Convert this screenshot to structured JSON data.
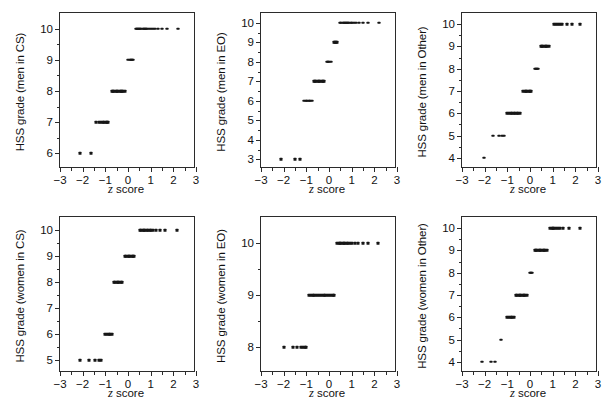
{
  "figure": {
    "axis_labels": {
      "x": "z score",
      "x_italic_part": "z",
      "x_rest": " score"
    },
    "x_range": [
      -3,
      3
    ],
    "x_ticks": [
      -3,
      -2,
      -1,
      0,
      1,
      2,
      3
    ],
    "x_tick_labels": [
      "−3",
      "−2",
      "−1",
      "0",
      "1",
      "2",
      "3"
    ]
  },
  "chart_data": [
    {
      "type": "scatter",
      "title": "",
      "xlabel": "z score",
      "ylabel": "HSS grade (men in CS)",
      "xlim": [
        -3,
        3
      ],
      "ylim": [
        5.5,
        10.5
      ],
      "yticks": [
        6,
        7,
        8,
        9,
        10
      ],
      "ytick_labels": [
        "6",
        "7",
        "8",
        "9",
        "10"
      ],
      "grid": false,
      "legend": "none",
      "points": [
        {
          "x": -2.12,
          "y": 6
        },
        {
          "x": -1.65,
          "y": 6
        },
        {
          "x": -1.42,
          "y": 7
        },
        {
          "x": -1.3,
          "y": 7
        },
        {
          "x": -1.2,
          "y": 7
        },
        {
          "x": -1.12,
          "y": 7
        },
        {
          "x": -1.05,
          "y": 7
        },
        {
          "x": -0.99,
          "y": 7
        },
        {
          "x": -0.93,
          "y": 7
        },
        {
          "x": -0.88,
          "y": 7
        },
        {
          "x": -0.72,
          "y": 8
        },
        {
          "x": -0.66,
          "y": 8
        },
        {
          "x": -0.6,
          "y": 8
        },
        {
          "x": -0.54,
          "y": 8
        },
        {
          "x": -0.48,
          "y": 8
        },
        {
          "x": -0.42,
          "y": 8
        },
        {
          "x": -0.36,
          "y": 8
        },
        {
          "x": -0.3,
          "y": 8
        },
        {
          "x": -0.25,
          "y": 8
        },
        {
          "x": -0.2,
          "y": 8
        },
        {
          "x": -0.15,
          "y": 8
        },
        {
          "x": 0.02,
          "y": 9
        },
        {
          "x": 0.07,
          "y": 9
        },
        {
          "x": 0.12,
          "y": 9
        },
        {
          "x": 0.17,
          "y": 9
        },
        {
          "x": 0.22,
          "y": 9
        },
        {
          "x": 0.34,
          "y": 10
        },
        {
          "x": 0.39,
          "y": 10
        },
        {
          "x": 0.44,
          "y": 10
        },
        {
          "x": 0.49,
          "y": 10
        },
        {
          "x": 0.54,
          "y": 10
        },
        {
          "x": 0.59,
          "y": 10
        },
        {
          "x": 0.64,
          "y": 10
        },
        {
          "x": 0.69,
          "y": 10
        },
        {
          "x": 0.74,
          "y": 10
        },
        {
          "x": 0.79,
          "y": 10
        },
        {
          "x": 0.85,
          "y": 10
        },
        {
          "x": 0.92,
          "y": 10
        },
        {
          "x": 1.0,
          "y": 10
        },
        {
          "x": 1.09,
          "y": 10
        },
        {
          "x": 1.2,
          "y": 10
        },
        {
          "x": 1.33,
          "y": 10
        },
        {
          "x": 1.5,
          "y": 10
        },
        {
          "x": 1.72,
          "y": 10
        },
        {
          "x": 2.2,
          "y": 10
        }
      ]
    },
    {
      "type": "scatter",
      "title": "",
      "xlabel": "z score",
      "ylabel": "HSS grade (men in EO)",
      "xlim": [
        -3,
        3
      ],
      "ylim": [
        2.5,
        10.5
      ],
      "yticks": [
        3,
        4,
        5,
        6,
        7,
        8,
        9,
        10
      ],
      "ytick_labels": [
        "3",
        "4",
        "5",
        "6",
        "7",
        "8",
        "9",
        "10"
      ],
      "grid": false,
      "legend": "none",
      "points": [
        {
          "x": -2.12,
          "y": 3
        },
        {
          "x": -1.5,
          "y": 3
        },
        {
          "x": -1.3,
          "y": 3
        },
        {
          "x": -1.1,
          "y": 6
        },
        {
          "x": -1.03,
          "y": 6
        },
        {
          "x": -0.96,
          "y": 6
        },
        {
          "x": -0.89,
          "y": 6
        },
        {
          "x": -0.82,
          "y": 6
        },
        {
          "x": -0.76,
          "y": 6
        },
        {
          "x": -0.68,
          "y": 7
        },
        {
          "x": -0.62,
          "y": 7
        },
        {
          "x": -0.56,
          "y": 7
        },
        {
          "x": -0.5,
          "y": 7
        },
        {
          "x": -0.44,
          "y": 7
        },
        {
          "x": -0.38,
          "y": 7
        },
        {
          "x": -0.32,
          "y": 7
        },
        {
          "x": -0.26,
          "y": 7
        },
        {
          "x": -0.2,
          "y": 7
        },
        {
          "x": -0.08,
          "y": 8
        },
        {
          "x": -0.03,
          "y": 8
        },
        {
          "x": 0.02,
          "y": 8
        },
        {
          "x": 0.07,
          "y": 8
        },
        {
          "x": 0.2,
          "y": 9
        },
        {
          "x": 0.25,
          "y": 9
        },
        {
          "x": 0.3,
          "y": 9
        },
        {
          "x": 0.35,
          "y": 9
        },
        {
          "x": 0.5,
          "y": 10
        },
        {
          "x": 0.55,
          "y": 10
        },
        {
          "x": 0.6,
          "y": 10
        },
        {
          "x": 0.65,
          "y": 10
        },
        {
          "x": 0.7,
          "y": 10
        },
        {
          "x": 0.75,
          "y": 10
        },
        {
          "x": 0.8,
          "y": 10
        },
        {
          "x": 0.85,
          "y": 10
        },
        {
          "x": 0.9,
          "y": 10
        },
        {
          "x": 0.96,
          "y": 10
        },
        {
          "x": 1.03,
          "y": 10
        },
        {
          "x": 1.11,
          "y": 10
        },
        {
          "x": 1.2,
          "y": 10
        },
        {
          "x": 1.32,
          "y": 10
        },
        {
          "x": 1.48,
          "y": 10
        },
        {
          "x": 1.7,
          "y": 10
        },
        {
          "x": 2.2,
          "y": 10
        }
      ]
    },
    {
      "type": "scatter",
      "title": "",
      "xlabel": "z score",
      "ylabel": "HSS grade (men in Other)",
      "xlim": [
        -3,
        3
      ],
      "ylim": [
        3.5,
        10.5
      ],
      "yticks": [
        4,
        5,
        6,
        7,
        8,
        9,
        10
      ],
      "ytick_labels": [
        "4",
        "5",
        "6",
        "7",
        "8",
        "9",
        "10"
      ],
      "grid": false,
      "legend": "none",
      "points": [
        {
          "x": -2.05,
          "y": 4
        },
        {
          "x": -1.62,
          "y": 5
        },
        {
          "x": -1.38,
          "y": 5
        },
        {
          "x": -1.25,
          "y": 5
        },
        {
          "x": -1.13,
          "y": 5
        },
        {
          "x": -1.0,
          "y": 6
        },
        {
          "x": -0.93,
          "y": 6
        },
        {
          "x": -0.86,
          "y": 6
        },
        {
          "x": -0.79,
          "y": 6
        },
        {
          "x": -0.72,
          "y": 6
        },
        {
          "x": -0.65,
          "y": 6
        },
        {
          "x": -0.58,
          "y": 6
        },
        {
          "x": -0.51,
          "y": 6
        },
        {
          "x": -0.45,
          "y": 6
        },
        {
          "x": -0.3,
          "y": 7
        },
        {
          "x": -0.24,
          "y": 7
        },
        {
          "x": -0.18,
          "y": 7
        },
        {
          "x": -0.12,
          "y": 7
        },
        {
          "x": -0.06,
          "y": 7
        },
        {
          "x": 0.0,
          "y": 7
        },
        {
          "x": 0.06,
          "y": 7
        },
        {
          "x": 0.2,
          "y": 8
        },
        {
          "x": 0.25,
          "y": 8
        },
        {
          "x": 0.3,
          "y": 8
        },
        {
          "x": 0.35,
          "y": 8
        },
        {
          "x": 0.47,
          "y": 9
        },
        {
          "x": 0.53,
          "y": 9
        },
        {
          "x": 0.59,
          "y": 9
        },
        {
          "x": 0.65,
          "y": 9
        },
        {
          "x": 0.71,
          "y": 9
        },
        {
          "x": 0.77,
          "y": 9
        },
        {
          "x": 0.83,
          "y": 9
        },
        {
          "x": 1.08,
          "y": 10
        },
        {
          "x": 1.16,
          "y": 10
        },
        {
          "x": 1.24,
          "y": 10
        },
        {
          "x": 1.33,
          "y": 10
        },
        {
          "x": 1.43,
          "y": 10
        },
        {
          "x": 1.62,
          "y": 10
        },
        {
          "x": 1.85,
          "y": 10
        },
        {
          "x": 2.2,
          "y": 10
        }
      ]
    },
    {
      "type": "scatter",
      "title": "",
      "xlabel": "z score",
      "ylabel": "HSS grade (women in CS)",
      "xlim": [
        -3,
        3
      ],
      "ylim": [
        4.5,
        10.5
      ],
      "yticks": [
        5,
        6,
        7,
        8,
        9,
        10
      ],
      "ytick_labels": [
        "5",
        "6",
        "7",
        "8",
        "9",
        "10"
      ],
      "grid": false,
      "legend": "none",
      "points": [
        {
          "x": -2.1,
          "y": 5
        },
        {
          "x": -1.7,
          "y": 5
        },
        {
          "x": -1.45,
          "y": 5
        },
        {
          "x": -1.3,
          "y": 5
        },
        {
          "x": -1.2,
          "y": 5
        },
        {
          "x": -1.0,
          "y": 6
        },
        {
          "x": -0.93,
          "y": 6
        },
        {
          "x": -0.86,
          "y": 6
        },
        {
          "x": -0.79,
          "y": 6
        },
        {
          "x": -0.72,
          "y": 6
        },
        {
          "x": -0.62,
          "y": 8
        },
        {
          "x": -0.56,
          "y": 8
        },
        {
          "x": -0.5,
          "y": 8
        },
        {
          "x": -0.44,
          "y": 8
        },
        {
          "x": -0.38,
          "y": 8
        },
        {
          "x": -0.32,
          "y": 8
        },
        {
          "x": -0.26,
          "y": 8
        },
        {
          "x": -0.14,
          "y": 9
        },
        {
          "x": -0.08,
          "y": 9
        },
        {
          "x": -0.02,
          "y": 9
        },
        {
          "x": 0.04,
          "y": 9
        },
        {
          "x": 0.1,
          "y": 9
        },
        {
          "x": 0.16,
          "y": 9
        },
        {
          "x": 0.22,
          "y": 9
        },
        {
          "x": 0.28,
          "y": 9
        },
        {
          "x": 0.52,
          "y": 10
        },
        {
          "x": 0.58,
          "y": 10
        },
        {
          "x": 0.64,
          "y": 10
        },
        {
          "x": 0.7,
          "y": 10
        },
        {
          "x": 0.76,
          "y": 10
        },
        {
          "x": 0.82,
          "y": 10
        },
        {
          "x": 0.88,
          "y": 10
        },
        {
          "x": 0.95,
          "y": 10
        },
        {
          "x": 1.03,
          "y": 10
        },
        {
          "x": 1.12,
          "y": 10
        },
        {
          "x": 1.24,
          "y": 10
        },
        {
          "x": 1.42,
          "y": 10
        },
        {
          "x": 1.65,
          "y": 10
        },
        {
          "x": 2.15,
          "y": 10
        }
      ]
    },
    {
      "type": "scatter",
      "title": "",
      "xlabel": "z score",
      "ylabel": "HSS grade (women in EO)",
      "xlim": [
        -3,
        3
      ],
      "ylim": [
        7.5,
        10.5
      ],
      "yticks": [
        8,
        9,
        10
      ],
      "ytick_labels": [
        "8",
        "9",
        "10"
      ],
      "grid": false,
      "legend": "none",
      "points": [
        {
          "x": -2.0,
          "y": 8
        },
        {
          "x": -1.6,
          "y": 8
        },
        {
          "x": -1.4,
          "y": 8
        },
        {
          "x": -1.25,
          "y": 8
        },
        {
          "x": -1.15,
          "y": 8
        },
        {
          "x": -1.08,
          "y": 8
        },
        {
          "x": -1.02,
          "y": 8
        },
        {
          "x": -0.88,
          "y": 9
        },
        {
          "x": -0.8,
          "y": 9
        },
        {
          "x": -0.72,
          "y": 9
        },
        {
          "x": -0.64,
          "y": 9
        },
        {
          "x": -0.56,
          "y": 9
        },
        {
          "x": -0.48,
          "y": 9
        },
        {
          "x": -0.4,
          "y": 9
        },
        {
          "x": -0.32,
          "y": 9
        },
        {
          "x": -0.24,
          "y": 9
        },
        {
          "x": -0.16,
          "y": 9
        },
        {
          "x": -0.08,
          "y": 9
        },
        {
          "x": 0.0,
          "y": 9
        },
        {
          "x": 0.08,
          "y": 9
        },
        {
          "x": 0.16,
          "y": 9
        },
        {
          "x": 0.24,
          "y": 9
        },
        {
          "x": 0.36,
          "y": 10
        },
        {
          "x": 0.42,
          "y": 10
        },
        {
          "x": 0.48,
          "y": 10
        },
        {
          "x": 0.54,
          "y": 10
        },
        {
          "x": 0.6,
          "y": 10
        },
        {
          "x": 0.66,
          "y": 10
        },
        {
          "x": 0.72,
          "y": 10
        },
        {
          "x": 0.78,
          "y": 10
        },
        {
          "x": 0.85,
          "y": 10
        },
        {
          "x": 0.93,
          "y": 10
        },
        {
          "x": 1.02,
          "y": 10
        },
        {
          "x": 1.13,
          "y": 10
        },
        {
          "x": 1.28,
          "y": 10
        },
        {
          "x": 1.48,
          "y": 10
        },
        {
          "x": 1.7,
          "y": 10
        },
        {
          "x": 2.15,
          "y": 10
        }
      ]
    },
    {
      "type": "scatter",
      "title": "",
      "xlabel": "z score",
      "ylabel": "HSS grade (women in Other)",
      "xlim": [
        -3,
        3
      ],
      "ylim": [
        3.5,
        10.5
      ],
      "yticks": [
        4,
        5,
        6,
        7,
        8,
        9,
        10
      ],
      "ytick_labels": [
        "4",
        "5",
        "6",
        "7",
        "8",
        "9",
        "10"
      ],
      "grid": false,
      "legend": "none",
      "points": [
        {
          "x": -2.1,
          "y": 4
        },
        {
          "x": -1.7,
          "y": 4
        },
        {
          "x": -1.55,
          "y": 4
        },
        {
          "x": -1.3,
          "y": 5
        },
        {
          "x": -1.0,
          "y": 6
        },
        {
          "x": -0.93,
          "y": 6
        },
        {
          "x": -0.86,
          "y": 6
        },
        {
          "x": -0.79,
          "y": 6
        },
        {
          "x": -0.72,
          "y": 6
        },
        {
          "x": -0.62,
          "y": 7
        },
        {
          "x": -0.56,
          "y": 7
        },
        {
          "x": -0.5,
          "y": 7
        },
        {
          "x": -0.44,
          "y": 7
        },
        {
          "x": -0.38,
          "y": 7
        },
        {
          "x": -0.32,
          "y": 7
        },
        {
          "x": -0.26,
          "y": 7
        },
        {
          "x": -0.2,
          "y": 7
        },
        {
          "x": -0.14,
          "y": 7
        },
        {
          "x": -0.02,
          "y": 8
        },
        {
          "x": 0.03,
          "y": 8
        },
        {
          "x": 0.08,
          "y": 8
        },
        {
          "x": 0.2,
          "y": 9
        },
        {
          "x": 0.26,
          "y": 9
        },
        {
          "x": 0.32,
          "y": 9
        },
        {
          "x": 0.38,
          "y": 9
        },
        {
          "x": 0.44,
          "y": 9
        },
        {
          "x": 0.5,
          "y": 9
        },
        {
          "x": 0.56,
          "y": 9
        },
        {
          "x": 0.62,
          "y": 9
        },
        {
          "x": 0.68,
          "y": 9
        },
        {
          "x": 0.74,
          "y": 9
        },
        {
          "x": 0.9,
          "y": 10
        },
        {
          "x": 0.96,
          "y": 10
        },
        {
          "x": 1.02,
          "y": 10
        },
        {
          "x": 1.08,
          "y": 10
        },
        {
          "x": 1.15,
          "y": 10
        },
        {
          "x": 1.23,
          "y": 10
        },
        {
          "x": 1.33,
          "y": 10
        },
        {
          "x": 1.47,
          "y": 10
        },
        {
          "x": 1.7,
          "y": 10
        },
        {
          "x": 2.2,
          "y": 10
        }
      ]
    }
  ]
}
